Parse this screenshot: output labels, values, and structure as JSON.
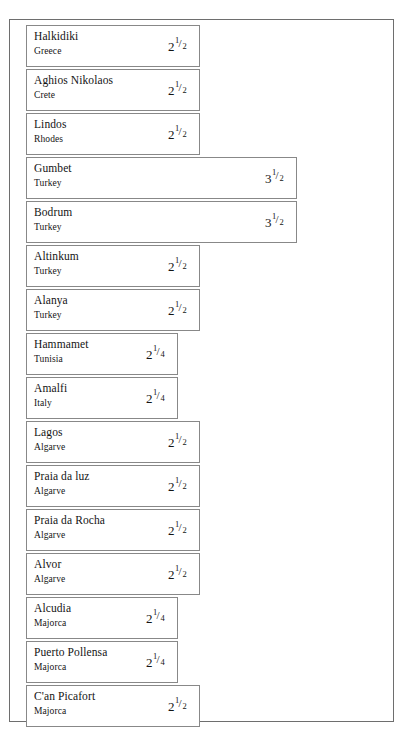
{
  "chart_data": {
    "type": "bar",
    "title": "",
    "subtitle": "",
    "xlabel": "",
    "ylabel": "",
    "orientation": "horizontal",
    "grid": false,
    "legend": null,
    "xlim": [
      0,
      4
    ],
    "value_display": "mixed-fraction",
    "categories": [
      "Halkidiki",
      "Aghios Nikolaos",
      "Lindos",
      "Gumbet",
      "Bodrum",
      "Altinkum",
      "Alanya",
      "Hammamet",
      "Amalfi",
      "Lagos",
      "Praia da luz",
      "Praia da Rocha",
      "Alvor",
      "Alcudia",
      "Puerto Pollensa",
      "C'an Picafort"
    ],
    "regions": [
      "Greece",
      "Crete",
      "Rhodes",
      "Turkey",
      "Turkey",
      "Turkey",
      "Turkey",
      "Tunisia",
      "Italy",
      "Algarve",
      "Algarve",
      "Algarve",
      "Algarve",
      "Majorca",
      "Majorca",
      "Majorca"
    ],
    "values": [
      2.5,
      2.5,
      2.5,
      3.5,
      3.5,
      2.5,
      2.5,
      2.25,
      2.25,
      2.5,
      2.5,
      2.5,
      2.5,
      2.25,
      2.25,
      2.5
    ],
    "value_labels": [
      "2 1/2",
      "2 1/2",
      "2 1/2",
      "3 1/2",
      "3 1/2",
      "2 1/2",
      "2 1/2",
      "2 1/4",
      "2 1/4",
      "2 1/2",
      "2 1/2",
      "2 1/2",
      "2 1/2",
      "2 1/4",
      "2 1/4",
      "2 1/2"
    ]
  },
  "bars": [
    {
      "name": "Halkidiki",
      "region": "Greece",
      "int": "2",
      "num": "1",
      "slash": "/",
      "den": "2",
      "width": 174,
      "top": 5
    },
    {
      "name": "Aghios Nikolaos",
      "region": "Crete",
      "int": "2",
      "num": "1",
      "slash": "/",
      "den": "2",
      "width": 174,
      "top": 49
    },
    {
      "name": "Lindos",
      "region": "Rhodes",
      "int": "2",
      "num": "1",
      "slash": "/",
      "den": "2",
      "width": 174,
      "top": 93
    },
    {
      "name": "Gumbet",
      "region": "Turkey",
      "int": "3",
      "num": "1",
      "slash": "/",
      "den": "2",
      "width": 271,
      "top": 137
    },
    {
      "name": "Bodrum",
      "region": "Turkey",
      "int": "3",
      "num": "1",
      "slash": "/",
      "den": "2",
      "width": 271,
      "top": 181
    },
    {
      "name": "Altinkum",
      "region": "Turkey",
      "int": "2",
      "num": "1",
      "slash": "/",
      "den": "2",
      "width": 174,
      "top": 225
    },
    {
      "name": "Alanya",
      "region": "Turkey",
      "int": "2",
      "num": "1",
      "slash": "/",
      "den": "2",
      "width": 174,
      "top": 269
    },
    {
      "name": "Hammamet",
      "region": "Tunisia",
      "int": "2",
      "num": "1",
      "slash": "/",
      "den": "4",
      "width": 152,
      "top": 313
    },
    {
      "name": "Amalfi",
      "region": "Italy",
      "int": "2",
      "num": "1",
      "slash": "/",
      "den": "4",
      "width": 152,
      "top": 357
    },
    {
      "name": "Lagos",
      "region": "Algarve",
      "int": "2",
      "num": "1",
      "slash": "/",
      "den": "2",
      "width": 174,
      "top": 401
    },
    {
      "name": "Praia da luz",
      "region": "Algarve",
      "int": "2",
      "num": "1",
      "slash": "/",
      "den": "2",
      "width": 174,
      "top": 445
    },
    {
      "name": "Praia da Rocha",
      "region": "Algarve",
      "int": "2",
      "num": "1",
      "slash": "/",
      "den": "2",
      "width": 174,
      "top": 489
    },
    {
      "name": "Alvor",
      "region": "Algarve",
      "int": "2",
      "num": "1",
      "slash": "/",
      "den": "2",
      "width": 174,
      "top": 533
    },
    {
      "name": "Alcudia",
      "region": "Majorca",
      "int": "2",
      "num": "1",
      "slash": "/",
      "den": "4",
      "width": 152,
      "top": 577
    },
    {
      "name": "Puerto Pollensa",
      "region": "Majorca",
      "int": "2",
      "num": "1",
      "slash": "/",
      "den": "4",
      "width": 152,
      "top": 621
    },
    {
      "name": "C'an Picafort",
      "region": "Majorca",
      "int": "2",
      "num": "1",
      "slash": "/",
      "den": "2",
      "width": 174,
      "top": 665
    }
  ]
}
